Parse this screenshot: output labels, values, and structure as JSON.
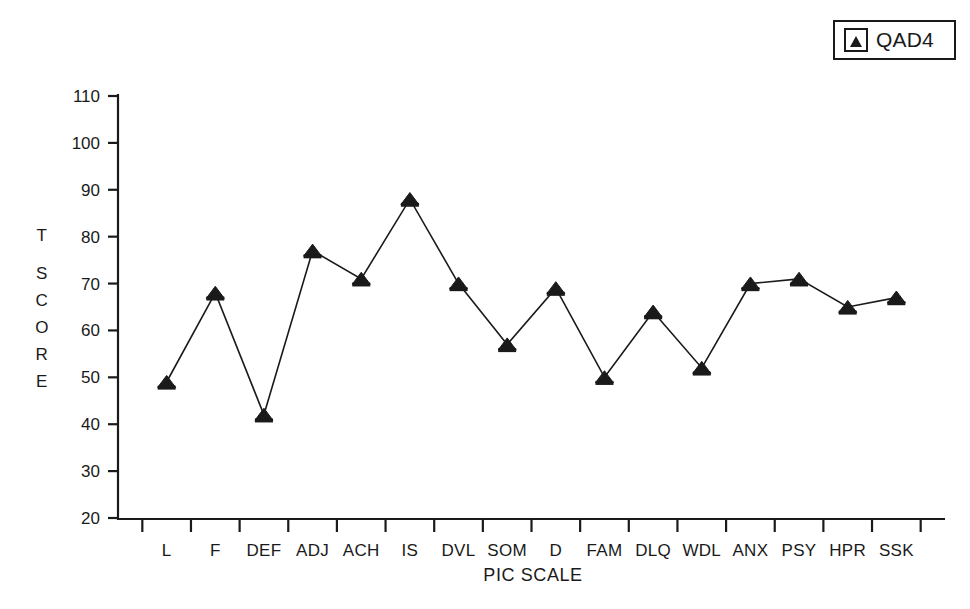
{
  "legend": {
    "entries": [
      {
        "label": "QAD4",
        "marker": "triangle-marker",
        "color": "#1a1a1a"
      }
    ]
  },
  "axis": {
    "y_title_lines": [
      "T",
      "S",
      "C",
      "O",
      "R",
      "E"
    ],
    "x_title": "PIC SCALE"
  },
  "chart_data": {
    "type": "line",
    "title": "",
    "subtitle": "",
    "xlabel": "PIC SCALE",
    "ylabel": "T SCORE",
    "categories": [
      "L",
      "F",
      "DEF",
      "ADJ",
      "ACH",
      "IS",
      "DVL",
      "SOM",
      "D",
      "FAM",
      "DLQ",
      "WDL",
      "ANX",
      "PSY",
      "HPR",
      "SSK"
    ],
    "series": [
      {
        "name": "QAD4",
        "marker": "triangle",
        "color": "#1a1a1a",
        "values": [
          49,
          68,
          42,
          77,
          71,
          88,
          70,
          57,
          69,
          50,
          64,
          52,
          70,
          71,
          65,
          67
        ]
      }
    ],
    "ylim": [
      20,
      110
    ],
    "yticks": [
      20,
      30,
      40,
      50,
      60,
      70,
      80,
      90,
      100,
      110
    ],
    "ytick_labels": [
      "20",
      "30",
      "40",
      "50",
      "60",
      "70",
      "80",
      "90",
      "100",
      "110"
    ],
    "grid": false,
    "legend_position": "top-right"
  }
}
